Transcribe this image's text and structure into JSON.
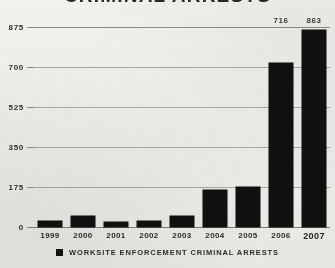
{
  "chart_data": {
    "type": "bar",
    "title": "CRIMINAL ARRESTS",
    "xlabel": "",
    "ylabel": "",
    "ylim": [
      0,
      875
    ],
    "yticks": [
      "0",
      "175",
      "350",
      "525",
      "700",
      "875"
    ],
    "grid": true,
    "legend_position": "bottom",
    "categories": [
      "1999",
      "2000",
      "2001",
      "2002",
      "2003",
      "2004",
      "2005",
      "2006",
      "2007"
    ],
    "series": [
      {
        "name": "Worksite Enforcement Criminal Arrests",
        "color": "#111010",
        "values": [
          25,
          50,
          20,
          25,
          50,
          160,
          175,
          716,
          863
        ],
        "labels": [
          "",
          "",
          "",
          "",
          "",
          "",
          "",
          "716",
          "863"
        ]
      }
    ]
  },
  "legend": {
    "swatch_color": "#121212",
    "label": "Worksite Enforcement Criminal Arrests"
  }
}
